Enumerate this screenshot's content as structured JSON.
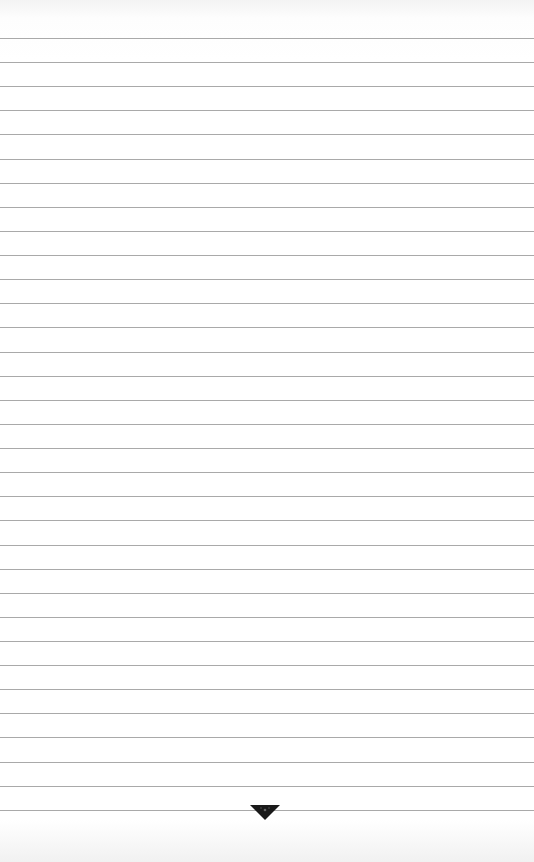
{
  "page": {
    "type": "lined-paper",
    "rule_color": "#a9a9a9",
    "background_color": "#ffffff",
    "rules": {
      "count": 33,
      "first_y": 38,
      "spacing": 24.12
    },
    "ornament": {
      "icon": "downward-triangle-ornament-icon",
      "color": "#1a1a1a"
    }
  }
}
